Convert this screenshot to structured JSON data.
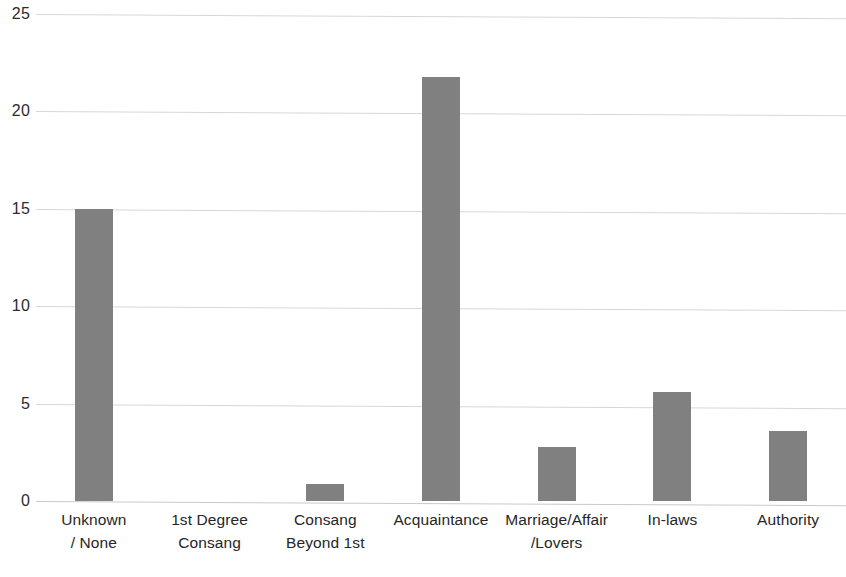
{
  "chart_data": {
    "type": "bar",
    "title": "",
    "subtitle": "",
    "xlabel": "",
    "ylabel": "",
    "categories": [
      "Unknown / None",
      "1st Degree Consang",
      "Consang Beyond 1st",
      "Acquaintance",
      "Marriage/Affair /Lovers",
      "In-laws",
      "Authority"
    ],
    "category_lines": [
      [
        "Unknown",
        "/ None"
      ],
      [
        "1st Degree",
        "Consang"
      ],
      [
        "Consang",
        "Beyond 1st"
      ],
      [
        "Acquaintance",
        ""
      ],
      [
        "Marriage/Affair",
        "/Lovers"
      ],
      [
        "In-laws",
        ""
      ],
      [
        "Authority",
        ""
      ]
    ],
    "values": [
      15.0,
      0,
      0.85,
      21.75,
      2.75,
      5.6,
      3.6
    ],
    "ylim": [
      0,
      25
    ],
    "yticks": [
      0,
      5,
      10,
      15,
      20,
      25
    ],
    "ytick_labels": [
      "0",
      "5",
      "10",
      "15",
      "20",
      "25"
    ],
    "grid": true,
    "legend": false,
    "legend_position": "none",
    "bar_color": "#808080",
    "gridline_color": "#d7d7d7",
    "axis_text_color": "#2b2b2b",
    "background_color": "#ffffff"
  }
}
